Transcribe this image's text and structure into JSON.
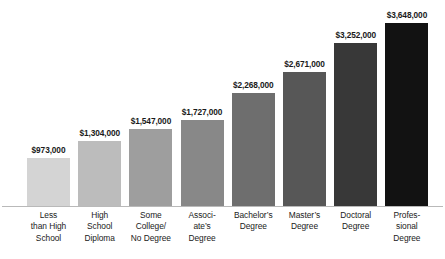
{
  "chart_data": {
    "type": "bar",
    "title": "",
    "subtitle": "",
    "xlabel": "",
    "ylabel": "",
    "grid": false,
    "legend": false,
    "ylim": [
      0,
      3648000
    ],
    "value_prefix": "$",
    "categories": [
      "Less than High School",
      "High School Diploma",
      "Some College/ No Degree",
      "Associate's Degree",
      "Bachelor's Degree",
      "Master's Degree",
      "Doctoral Degree",
      "Professional Degree"
    ],
    "category_lines": [
      [
        "Less",
        "than High",
        "School"
      ],
      [
        "High",
        "School",
        "Diploma"
      ],
      [
        "Some",
        "College/",
        "No Degree"
      ],
      [
        "Associ-",
        "ate’s",
        "Degree"
      ],
      [
        "Bachelor’s",
        "Degree"
      ],
      [
        "Master’s",
        "Degree"
      ],
      [
        "Doctoral",
        "Degree"
      ],
      [
        "Profes-",
        "sional",
        "Degree"
      ]
    ],
    "values": [
      973000,
      1304000,
      1547000,
      1727000,
      2268000,
      2671000,
      3252000,
      3648000
    ],
    "value_labels": [
      "$973,000",
      "$1,304,000",
      "$1,547,000",
      "$1,727,000",
      "$2,268,000",
      "$2,671,000",
      "$3,252,000",
      "$3,648,000"
    ],
    "bar_colors": [
      "#d4d4d4",
      "#bcbcbc",
      "#9e9e9e",
      "#888888",
      "#6e6e6e",
      "#575757",
      "#383838",
      "#121212"
    ]
  },
  "axis": {
    "baseline_color": "#b9b9b9"
  }
}
